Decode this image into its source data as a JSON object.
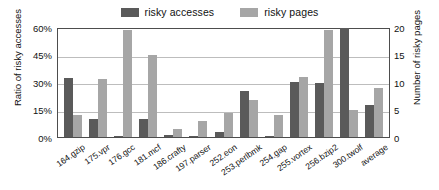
{
  "legend": {
    "position": "top-center",
    "entries": [
      {
        "label": "risky accesses",
        "color": "#5a5a5a"
      },
      {
        "label": "risky pages",
        "color": "#a6a6a6"
      }
    ]
  },
  "axes": {
    "left": {
      "title": "Ratio of risky accesses",
      "ticks": [
        "0%",
        "15%",
        "30%",
        "45%",
        "60%"
      ],
      "min": 0,
      "max": 60
    },
    "right": {
      "title": "Number of risky pages",
      "ticks": [
        "0",
        "5",
        "10",
        "15",
        "20"
      ],
      "min": 0,
      "max": 20
    }
  },
  "chart_data": {
    "type": "bar",
    "title": "",
    "xlabel": "",
    "ylabel": "Ratio of risky accesses",
    "y2label": "Number of risky pages",
    "ylim": [
      0,
      60
    ],
    "y2lim": [
      0,
      20
    ],
    "grid": true,
    "legend_position": "top-center",
    "categories": [
      "164.gzip",
      "175.vpr",
      "176.gcc",
      "181.mcf",
      "186.crafty",
      "197.parser",
      "252.eon",
      "253.perlbmk",
      "254.gap",
      "255.vortex",
      "256.bzip2",
      "300.twolf",
      "average"
    ],
    "series": [
      {
        "name": "risky accesses",
        "axis": "left",
        "unit": "%",
        "color": "#5a5a5a",
        "values": [
          32,
          10,
          0.5,
          10,
          1.2,
          0.4,
          2.5,
          25,
          0.8,
          30,
          29.5,
          59.5,
          17.5
        ]
      },
      {
        "name": "risky pages",
        "axis": "right",
        "unit": "pages",
        "color": "#a6a6a6",
        "values": [
          4,
          10.5,
          19.5,
          15,
          1.5,
          3,
          4.3,
          6.7,
          4,
          11,
          19.5,
          5,
          9
        ]
      }
    ]
  }
}
